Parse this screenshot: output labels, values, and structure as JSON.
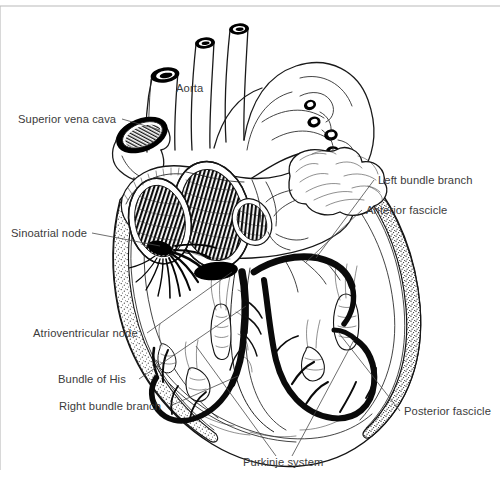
{
  "figure": {
    "background_color": "#ffffff",
    "ink_color": "#1a1a1a",
    "label_color": "#3b3b3b",
    "conduction_color": "#0a0a0a",
    "frame_line_color": "#b9b9b9"
  },
  "labels": {
    "aorta": "Aorta",
    "superior_vena_cava": "Superior vena cava",
    "sinoatrial_node": "Sinoatrial node",
    "atrioventricular_node": "Atrioventricular node",
    "bundle_of_his": "Bundle of His",
    "right_bundle_branch": "Right bundle branch",
    "left_bundle_branch": "Left bundle branch",
    "anterior_fascicle": "Anterior fascicle",
    "posterior_fascicle": "Posterior fascicle",
    "purkinje_system": "Purkinje system"
  },
  "label_positions": {
    "aorta": {
      "x": 176,
      "y": 92,
      "anchor": "start",
      "leader": false
    },
    "superior_vena_cava": {
      "x": 18,
      "y": 123,
      "anchor": "start",
      "leader": true
    },
    "sinoatrial_node": {
      "x": 11,
      "y": 237,
      "anchor": "start",
      "leader": true
    },
    "atrioventricular_node": {
      "x": 33,
      "y": 337,
      "anchor": "start",
      "leader": true
    },
    "bundle_of_his": {
      "x": 58,
      "y": 383,
      "anchor": "start",
      "leader": true
    },
    "right_bundle_branch": {
      "x": 59,
      "y": 410,
      "anchor": "start",
      "leader": true
    },
    "left_bundle_branch": {
      "x": 378,
      "y": 184,
      "anchor": "start",
      "leader": true
    },
    "anterior_fascicle": {
      "x": 366,
      "y": 214,
      "anchor": "start",
      "leader": true
    },
    "posterior_fascicle": {
      "x": 404,
      "y": 415,
      "anchor": "start",
      "leader": true
    },
    "purkinje_system": {
      "x": 243,
      "y": 466,
      "anchor": "start",
      "leader": true
    }
  },
  "structures": [
    {
      "name": "aorta",
      "kind": "great-vessel"
    },
    {
      "name": "superior-vena-cava",
      "kind": "great-vessel"
    },
    {
      "name": "brachiocephalic-trunk",
      "kind": "great-vessel"
    },
    {
      "name": "left-common-carotid-artery",
      "kind": "great-vessel"
    },
    {
      "name": "left-subclavian-artery",
      "kind": "great-vessel"
    },
    {
      "name": "pulmonary-veins",
      "kind": "great-vessel"
    },
    {
      "name": "right-atrium",
      "kind": "chamber"
    },
    {
      "name": "left-atrium",
      "kind": "chamber"
    },
    {
      "name": "right-ventricle",
      "kind": "chamber"
    },
    {
      "name": "left-ventricle",
      "kind": "chamber"
    },
    {
      "name": "interventricular-septum",
      "kind": "wall"
    },
    {
      "name": "papillary-muscle",
      "kind": "muscle"
    },
    {
      "name": "left-atrial-appendage",
      "kind": "appendage"
    }
  ],
  "conduction_pathway": [
    "sinoatrial-node",
    "internodal-tracts",
    "atrioventricular-node",
    "bundle-of-his",
    "right-bundle-branch",
    "left-bundle-branch",
    "anterior-fascicle",
    "posterior-fascicle",
    "purkinje-system"
  ]
}
